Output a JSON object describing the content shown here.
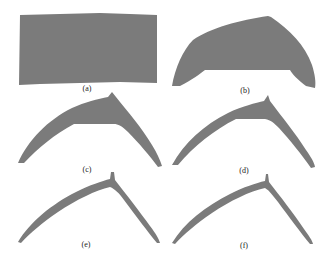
{
  "figure": {
    "fill_color": "#7b7b7b",
    "background_color": "#ffffff",
    "panels": [
      {
        "id": "a",
        "label": "(a)",
        "shape": "rectangle"
      },
      {
        "id": "b",
        "label": "(b)",
        "shape": "dome"
      },
      {
        "id": "c",
        "label": "(c)",
        "shape": "thick-arch"
      },
      {
        "id": "d",
        "label": "(d)",
        "shape": "medium-arch"
      },
      {
        "id": "e",
        "label": "(e)",
        "shape": "thin-arch"
      },
      {
        "id": "f",
        "label": "(f)",
        "shape": "thinner-arch"
      }
    ]
  }
}
